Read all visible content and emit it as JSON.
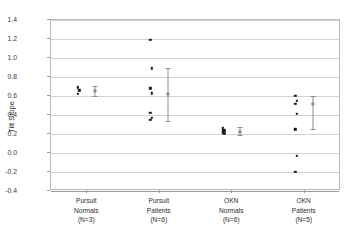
{
  "chart_data": {
    "type": "scatter",
    "title": "",
    "xlabel": "",
    "ylabel": "Tilt Slope",
    "ylim": [
      -0.4,
      1.4
    ],
    "ytick_step": 0.2,
    "grid": true,
    "legend": "none",
    "yticks": [
      "1.4",
      "1.2",
      "1.0",
      "0.8",
      "0.6",
      "0.4",
      "0.2",
      "0.0",
      "-0.2",
      "-0.4"
    ],
    "ytick_values": [
      1.4,
      1.2,
      1.0,
      0.8,
      0.6,
      0.4,
      0.2,
      0.0,
      -0.2,
      -0.4
    ],
    "categories": [
      "Pursuit\nNormals\n(N=3)",
      "Pursuit\nPatients\n(N=6)",
      "OKN\nNormals\n(N=6)",
      "OKN\nPatients\n(N=5)"
    ],
    "groups": [
      {
        "name": "Pursuit Normals",
        "label_lines": [
          "Pursuit",
          "Normals",
          "(N=3)"
        ],
        "n": 3,
        "values": [
          0.69,
          0.66,
          0.62
        ],
        "mean": 0.655,
        "error_low": 0.6,
        "error_high": 0.71
      },
      {
        "name": "Pursuit Patients",
        "label_lines": [
          "Pursuit",
          "Patients",
          "(N=6)"
        ],
        "n": 6,
        "values": [
          1.19,
          0.89,
          0.68,
          0.63,
          0.42,
          0.37,
          0.35
        ],
        "mean": 0.62,
        "error_low": 0.34,
        "error_high": 0.89
      },
      {
        "name": "OKN Normals",
        "label_lines": [
          "OKN",
          "Normals",
          "(N=6)"
        ],
        "n": 6,
        "values": [
          0.26,
          0.24,
          0.23,
          0.22,
          0.21,
          0.2
        ],
        "mean": 0.225,
        "error_low": 0.19,
        "error_high": 0.27
      },
      {
        "name": "OKN Patients",
        "label_lines": [
          "OKN",
          "Patients",
          "(N=5)"
        ],
        "n": 5,
        "values": [
          0.6,
          0.55,
          0.52,
          0.41,
          0.25,
          -0.03,
          -0.2
        ],
        "mean": 0.52,
        "error_low": 0.25,
        "error_high": 0.6
      }
    ],
    "colors": {
      "point": "#1a1a1a",
      "errorbar": "#8c8c8c",
      "gridline": "#d2d2d2",
      "axis": "#9a9a9a",
      "text": "#2b2b2b",
      "background": "#ffffff"
    }
  }
}
